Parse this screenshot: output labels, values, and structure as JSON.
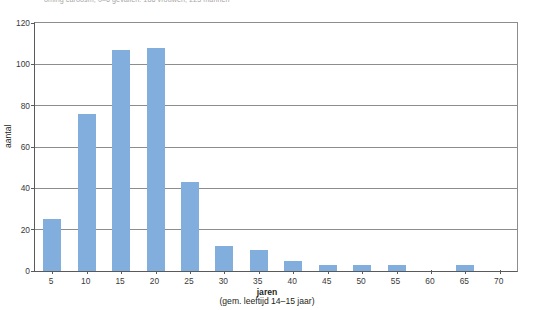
{
  "top_caption": "óming caroosm, 0–6 gevallen: 186 vrouwen, 225 mannen",
  "chart_data": {
    "type": "bar",
    "title": "",
    "subtitle": "",
    "xlabel": "jaren",
    "xlabel_sub": "(gem. leeftijd 14–15 jaar)",
    "ylabel": "aantal",
    "categories": [
      "5",
      "10",
      "15",
      "20",
      "25",
      "30",
      "35",
      "40",
      "45",
      "50",
      "55",
      "60",
      "65",
      "70"
    ],
    "values": [
      25,
      76,
      107,
      108,
      43,
      12,
      10,
      5,
      3,
      3,
      3,
      0,
      3,
      0
    ],
    "ylim": [
      0,
      120
    ],
    "yticks": [
      "0",
      "20",
      "40",
      "60",
      "80",
      "100",
      "120"
    ],
    "ytick_values": [
      0,
      20,
      40,
      60,
      80,
      100,
      120
    ],
    "xticks": [
      "5",
      "10",
      "15",
      "20",
      "25",
      "30",
      "35",
      "40",
      "45",
      "50",
      "55",
      "60",
      "65",
      "70"
    ],
    "grid": true,
    "grid_axis": "y",
    "legend": null,
    "legend_position": "none",
    "bar_color": "#82aedd",
    "axis_color": "#5a5a5a",
    "grid_color": "#8d8d8d",
    "background": "#ffffff"
  }
}
